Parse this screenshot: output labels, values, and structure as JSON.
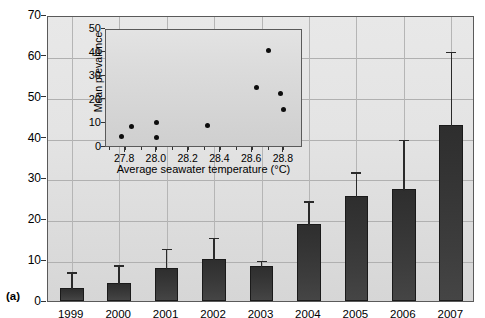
{
  "panel_label": "(a)",
  "main": {
    "ylabel": "Coral disease prevalence (%)",
    "yticks": [
      "0",
      "10",
      "20",
      "30",
      "40",
      "50",
      "60",
      "70"
    ],
    "xticks": [
      "1999",
      "2000",
      "2001",
      "2002",
      "2003",
      "2004",
      "2005",
      "2006",
      "2007"
    ]
  },
  "inset": {
    "ylabel": "Mean prevalence",
    "xlabel": "Average seawater temperature (°C)",
    "yticks": [
      "0",
      "10",
      "20",
      "30",
      "40",
      "50"
    ],
    "xticks": [
      "27.8",
      "28.0",
      "28.2",
      "28.4",
      "28.6",
      "28.8"
    ]
  },
  "colors": {
    "bar_fill": "#343434",
    "plot_bg": "#e4e4e4",
    "inset_bg": "#dcdcdc",
    "grid": "#b0b0b0",
    "axis": "#5a5a5a",
    "marker": "#0d0d0d"
  },
  "chart_data": [
    {
      "type": "bar",
      "title": "",
      "xlabel": "",
      "ylabel": "Coral disease prevalence (%)",
      "categories": [
        "1999",
        "2000",
        "2001",
        "2002",
        "2003",
        "2004",
        "2005",
        "2006",
        "2007"
      ],
      "values": [
        3.1,
        4.3,
        8.1,
        10.4,
        8.7,
        18.9,
        25.8,
        27.4,
        43.2
      ],
      "errors_upper": [
        7.5,
        9.2,
        13.3,
        16.0,
        10.3,
        24.9,
        32.0,
        40.0,
        61.5
      ],
      "error_type": "upper whisker (95% CI / SE upper limit)",
      "ylim": [
        0,
        70
      ],
      "ytick_step": 10,
      "grid": true,
      "legend": "none"
    },
    {
      "type": "scatter",
      "inset": true,
      "title": "",
      "xlabel": "Average seawater temperature (°C)",
      "ylabel": "Mean prevalence",
      "xlim": [
        27.68,
        28.92
      ],
      "ylim": [
        0,
        50
      ],
      "xtick_step": 0.2,
      "ytick_step": 10,
      "grid": false,
      "points": [
        {
          "x": 27.78,
          "y": 5.0
        },
        {
          "x": 27.84,
          "y": 9.0
        },
        {
          "x": 28.0,
          "y": 11.0
        },
        {
          "x": 28.0,
          "y": 4.3
        },
        {
          "x": 28.32,
          "y": 9.5
        },
        {
          "x": 28.63,
          "y": 25.5
        },
        {
          "x": 28.7,
          "y": 41.5
        },
        {
          "x": 28.78,
          "y": 23.0
        },
        {
          "x": 28.8,
          "y": 16.5
        }
      ]
    }
  ]
}
